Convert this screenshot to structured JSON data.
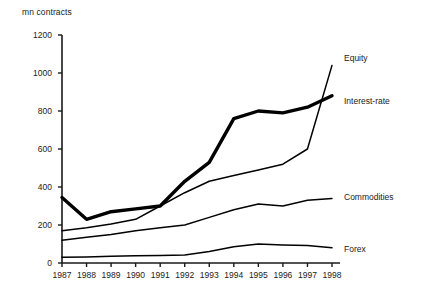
{
  "chart_data": {
    "type": "line",
    "title": "",
    "ylabel": "mn contracts",
    "xlabel": "",
    "ylim": [
      0,
      1200
    ],
    "yticks": [
      0,
      200,
      400,
      600,
      800,
      1000,
      1200
    ],
    "grid": false,
    "legend_position": "right-inline",
    "categories": [
      "1987",
      "1988",
      "1989",
      "1990",
      "1991",
      "1992",
      "1993",
      "1994",
      "1995",
      "1996",
      "1997",
      "1998"
    ],
    "series": [
      {
        "name": "Equity",
        "style": "thin",
        "values": [
          170,
          185,
          205,
          230,
          300,
          370,
          430,
          460,
          490,
          520,
          600,
          1040
        ]
      },
      {
        "name": "Interest-rate",
        "style": "thick",
        "values": [
          345,
          230,
          270,
          285,
          300,
          430,
          530,
          760,
          800,
          790,
          820,
          880
        ]
      },
      {
        "name": "Commodities",
        "style": "thin",
        "values": [
          120,
          135,
          150,
          170,
          185,
          200,
          240,
          280,
          310,
          300,
          330,
          340
        ]
      },
      {
        "name": "Forex",
        "style": "thin",
        "values": [
          30,
          32,
          35,
          38,
          40,
          42,
          60,
          85,
          100,
          95,
          92,
          80
        ]
      }
    ]
  },
  "labels": {
    "unit": "mn contracts",
    "equity": "Equity",
    "interest_rate": "Interest-rate",
    "commodities": "Commodities",
    "forex": "Forex"
  },
  "colors": {
    "line": "#000000",
    "axis": "#1a1a1a",
    "text": "#222222",
    "background": "#ffffff"
  }
}
